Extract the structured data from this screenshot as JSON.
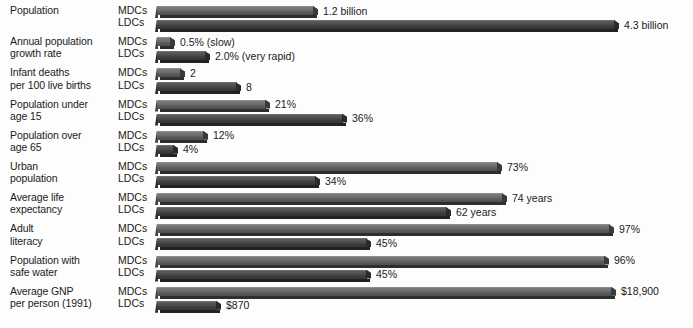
{
  "chart_data": {
    "type": "bar",
    "title": "",
    "subtitle": "",
    "xlabel": "",
    "ylabel": "",
    "grid": false,
    "legend_position": "inline-row-labels",
    "orientation": "horizontal",
    "series_names": [
      "MDCs",
      "LDCs"
    ],
    "categories": [
      "Population",
      "Annual population growth rate",
      "Infant deaths per 100 live births",
      "Population under age 15",
      "Population over age 65",
      "Urban population",
      "Average life expectancy",
      "Adult literacy",
      "Population with safe water",
      "Average GNP per person (1991)"
    ],
    "rows": [
      {
        "label_lines": [
          "Population",
          ""
        ],
        "mdc": {
          "series": "MDCs",
          "value": 1.2,
          "unit": "billion",
          "value_label": "1.2 billion",
          "bar_px": 157
        },
        "ldc": {
          "series": "LDCs",
          "value": 4.3,
          "unit": "billion",
          "value_label": "4.3 billion",
          "bar_px": 458
        }
      },
      {
        "label_lines": [
          "Annual population",
          "growth rate"
        ],
        "mdc": {
          "series": "MDCs",
          "value": 0.5,
          "unit": "%",
          "value_label": "0.5% (slow)",
          "bar_px": 14
        },
        "ldc": {
          "series": "LDCs",
          "value": 2.0,
          "unit": "%",
          "value_label": "2.0% (very rapid)",
          "bar_px": 49
        }
      },
      {
        "label_lines": [
          "Infant deaths",
          "per 100 live births"
        ],
        "mdc": {
          "series": "MDCs",
          "value": 2,
          "unit": "deaths",
          "value_label": "2",
          "bar_px": 24
        },
        "ldc": {
          "series": "LDCs",
          "value": 8,
          "unit": "deaths",
          "value_label": "8",
          "bar_px": 80
        }
      },
      {
        "label_lines": [
          "Population under",
          "age 15"
        ],
        "mdc": {
          "series": "MDCs",
          "value": 21,
          "unit": "%",
          "value_label": "21%",
          "bar_px": 109
        },
        "ldc": {
          "series": "LDCs",
          "value": 36,
          "unit": "%",
          "value_label": "36%",
          "bar_px": 186
        }
      },
      {
        "label_lines": [
          "Population over",
          "age 65"
        ],
        "mdc": {
          "series": "MDCs",
          "value": 12,
          "unit": "%",
          "value_label": "12%",
          "bar_px": 47
        },
        "ldc": {
          "series": "LDCs",
          "value": 4,
          "unit": "%",
          "value_label": "4%",
          "bar_px": 17
        }
      },
      {
        "label_lines": [
          "Urban",
          "population"
        ],
        "mdc": {
          "series": "MDCs",
          "value": 73,
          "unit": "%",
          "value_label": "73%",
          "bar_px": 341
        },
        "ldc": {
          "series": "LDCs",
          "value": 34,
          "unit": "%",
          "value_label": "34%",
          "bar_px": 159
        }
      },
      {
        "label_lines": [
          "Average life",
          "expectancy"
        ],
        "mdc": {
          "series": "MDCs",
          "value": 74,
          "unit": "years",
          "value_label": "74 years",
          "bar_px": 346
        },
        "ldc": {
          "series": "LDCs",
          "value": 62,
          "unit": "years",
          "value_label": "62 years",
          "bar_px": 290
        }
      },
      {
        "label_lines": [
          "Adult",
          "literacy"
        ],
        "mdc": {
          "series": "MDCs",
          "value": 97,
          "unit": "%",
          "value_label": "97%",
          "bar_px": 453
        },
        "ldc": {
          "series": "LDCs",
          "value": 45,
          "unit": "%",
          "value_label": "45%",
          "bar_px": 210
        }
      },
      {
        "label_lines": [
          "Population with",
          "safe water"
        ],
        "mdc": {
          "series": "MDCs",
          "value": 96,
          "unit": "%",
          "value_label": "96%",
          "bar_px": 448
        },
        "ldc": {
          "series": "LDCs",
          "value": 45,
          "unit": "%",
          "value_label": "45%",
          "bar_px": 210
        }
      },
      {
        "label_lines": [
          "Average GNP",
          "per person (1991)"
        ],
        "mdc": {
          "series": "MDCs",
          "value": 18900,
          "unit": "USD",
          "value_label": "$18,900",
          "bar_px": 455
        },
        "ldc": {
          "series": "LDCs",
          "value": 870,
          "unit": "USD",
          "value_label": "$870",
          "bar_px": 60
        }
      }
    ],
    "colors": {
      "background": "#fdfdfd",
      "mdc_bar": "#6e6e6e",
      "ldc_bar": "#4e4e4e",
      "bar_shadow": "#2e2e2e",
      "text": "#1b1b1b"
    }
  }
}
